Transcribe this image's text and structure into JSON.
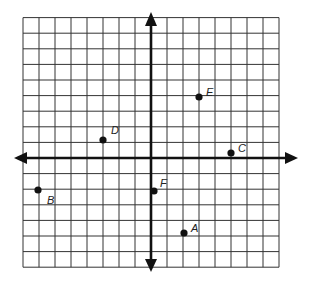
{
  "diagram": {
    "type": "coordinate-plane",
    "grid": {
      "x_min": -8,
      "x_max": 8,
      "y_min": -7,
      "y_max": 9,
      "origin_px": [
        151,
        158
      ],
      "cell_px": [
        16,
        15.6
      ],
      "line_color": "#333333",
      "axis_color": "#111111"
    },
    "points": [
      {
        "label": "A",
        "x": 2,
        "y": -5,
        "px": [
          184,
          233
        ],
        "label_dx": 7,
        "label_dy": -1
      },
      {
        "label": "B",
        "x": -7,
        "y": -2,
        "px": [
          38,
          190
        ],
        "label_dx": 9,
        "label_dy": 14
      },
      {
        "label": "C",
        "x": 5,
        "y": 0.3,
        "px": [
          231,
          153
        ],
        "label_dx": 7,
        "label_dy": -1
      },
      {
        "label": "D",
        "x": -3,
        "y": 1,
        "px": [
          103,
          140
        ],
        "label_dx": 8,
        "label_dy": -6
      },
      {
        "label": "E",
        "x": 3,
        "y": 4,
        "px": [
          199,
          97
        ],
        "label_dx": 7,
        "label_dy": -1
      },
      {
        "label": "F",
        "x": 0,
        "y": -2,
        "px": [
          154,
          191
        ],
        "label_dx": 6,
        "label_dy": -4
      }
    ]
  }
}
